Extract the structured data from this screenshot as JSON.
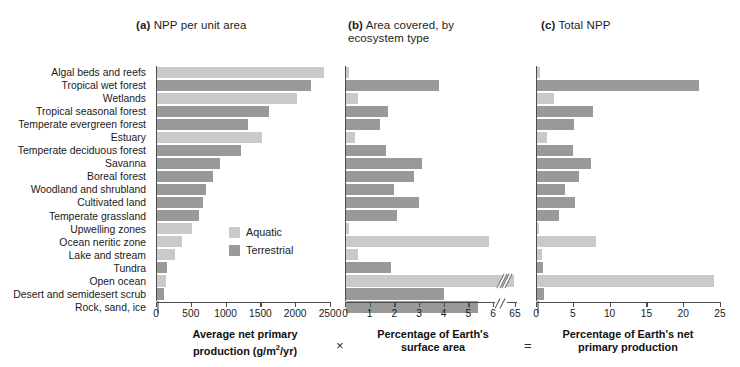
{
  "panels": {
    "a": {
      "tag": "(a)",
      "title": " NPP per unit area"
    },
    "b": {
      "tag": "(b)",
      "title": " Area covered, by",
      "title_line2": "ecosystem type"
    },
    "c": {
      "tag": "(c)",
      "title": " Total NPP"
    }
  },
  "operators": {
    "multiply": "×",
    "equals": "="
  },
  "legend": {
    "items": [
      {
        "label": "Aquatic",
        "color": "#c9c9c9",
        "key": "aquatic"
      },
      {
        "label": "Terrestrial",
        "color": "#999999",
        "key": "terrestrial"
      }
    ]
  },
  "categories": [
    "Algal beds and reefs",
    "Tropical wet forest",
    "Wetlands",
    "Tropical seasonal forest",
    "Temperate evergreen forest",
    "Estuary",
    "Temperate deciduous forest",
    "Savanna",
    "Boreal forest",
    "Woodland and shrubland",
    "Cultivated land",
    "Temperate grassland",
    "Upwelling zones",
    "Ocean neritic zone",
    "Lake and stream",
    "Tundra",
    "Open ocean",
    "Desert and semidesert scrub",
    "Rock, sand, ice"
  ],
  "types": [
    "aquatic",
    "terrestrial",
    "aquatic",
    "terrestrial",
    "terrestrial",
    "aquatic",
    "terrestrial",
    "terrestrial",
    "terrestrial",
    "terrestrial",
    "terrestrial",
    "terrestrial",
    "aquatic",
    "aquatic",
    "aquatic",
    "terrestrial",
    "aquatic",
    "terrestrial",
    "terrestrial"
  ],
  "chart_data": [
    {
      "type": "bar",
      "panel": "a",
      "title": "(a) NPP per unit area",
      "orientation": "horizontal",
      "xlabel": "Average net primary production (g/m²/yr)",
      "xlabel_line1": "Average net primary",
      "xlabel_line2": "production (g/m",
      "xlabel_units_sup": "2",
      "xlabel_line2_tail": "/yr)",
      "ylabel": "",
      "xlim": [
        0,
        2500
      ],
      "xticks": [
        0,
        500,
        1000,
        1500,
        2000,
        2500
      ],
      "xticklabels": [
        "0",
        "500",
        "1000",
        "1500",
        "2000",
        "2500"
      ],
      "grid": false,
      "categories": [
        "Algal beds and reefs",
        "Tropical wet forest",
        "Wetlands",
        "Tropical seasonal forest",
        "Temperate evergreen forest",
        "Estuary",
        "Temperate deciduous forest",
        "Savanna",
        "Boreal forest",
        "Woodland and shrubland",
        "Cultivated land",
        "Temperate grassland",
        "Upwelling zones",
        "Ocean neritic zone",
        "Lake and stream",
        "Tundra",
        "Open ocean",
        "Desert and semidesert scrub",
        "Rock, sand, ice"
      ],
      "values": [
        2400,
        2200,
        2000,
        1600,
        1300,
        1500,
        1200,
        900,
        800,
        700,
        650,
        600,
        500,
        360,
        250,
        140,
        125,
        90,
        3
      ]
    },
    {
      "type": "bar",
      "panel": "b",
      "title": "(b) Area covered, by ecosystem type",
      "orientation": "horizontal",
      "xlabel": "Percentage of Earth's surface area",
      "xlabel_line1": "Percentage of Earth's",
      "xlabel_line2": "surface area",
      "xlim": [
        0,
        6
      ],
      "xticks": [
        0,
        1,
        2,
        3,
        4,
        5,
        6,
        65
      ],
      "xticklabels": [
        "0",
        "1",
        "2",
        "3",
        "4",
        "5",
        "6",
        "65"
      ],
      "axis_break": {
        "after": 6,
        "resume_label": "65"
      },
      "grid": false,
      "categories": [
        "Algal beds and reefs",
        "Tropical wet forest",
        "Wetlands",
        "Tropical seasonal forest",
        "Temperate evergreen forest",
        "Estuary",
        "Temperate deciduous forest",
        "Savanna",
        "Boreal forest",
        "Woodland and shrubland",
        "Cultivated land",
        "Temperate grassland",
        "Upwelling zones",
        "Ocean neritic zone",
        "Lake and stream",
        "Tundra",
        "Open ocean",
        "Desert and semidesert scrub",
        "Rock, sand, ice"
      ],
      "values": [
        0.1,
        3.3,
        0.4,
        1.5,
        1.2,
        0.3,
        1.4,
        2.7,
        2.4,
        1.7,
        2.6,
        1.8,
        0.1,
        5.1,
        0.4,
        1.6,
        65.0,
        3.5,
        4.7
      ]
    },
    {
      "type": "bar",
      "panel": "c",
      "title": "(c) Total NPP",
      "orientation": "horizontal",
      "xlabel": "Percentage of Earth's net primary production",
      "xlabel_line1": "Percentage of Earth's net",
      "xlabel_line2": "primary production",
      "xlim": [
        0,
        25
      ],
      "xticks": [
        0,
        5,
        10,
        15,
        20,
        25
      ],
      "xticklabels": [
        "0",
        "5",
        "10",
        "15",
        "20",
        "25"
      ],
      "grid": false,
      "categories": [
        "Algal beds and reefs",
        "Tropical wet forest",
        "Wetlands",
        "Tropical seasonal forest",
        "Temperate evergreen forest",
        "Estuary",
        "Temperate deciduous forest",
        "Savanna",
        "Boreal forest",
        "Woodland and shrubland",
        "Cultivated land",
        "Temperate grassland",
        "Upwelling zones",
        "Ocean neritic zone",
        "Lake and stream",
        "Tundra",
        "Open ocean",
        "Desert and semidesert scrub",
        "Rock, sand, ice"
      ],
      "values": [
        0.35,
        22.0,
        2.3,
        7.6,
        5.0,
        1.3,
        4.9,
        7.3,
        5.6,
        3.7,
        5.1,
        3.0,
        0.2,
        8.0,
        0.6,
        0.7,
        24.0,
        0.9,
        0.1
      ]
    }
  ]
}
